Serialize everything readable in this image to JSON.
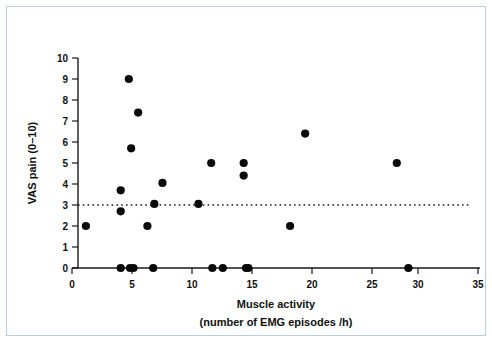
{
  "figure": {
    "background_color": "#ffffff",
    "border_color": "#b9cfdd"
  },
  "axes": {
    "x_title_line1": "Muscle activity",
    "x_title_line2": "(number of EMG episodes /h)",
    "y_title": "VAS pain (0–10)",
    "x_ticks": [
      "0",
      "5",
      "10",
      "15",
      "20",
      "25",
      "30",
      "35"
    ],
    "y_ticks": [
      "0",
      "1",
      "2",
      "3",
      "4",
      "5",
      "6",
      "7",
      "8",
      "9",
      "10"
    ]
  },
  "annotations": {
    "reference_line_value": 3,
    "reference_line_style": "dotted"
  },
  "chart_data": {
    "type": "scatter",
    "title": "",
    "xlabel": "Muscle activity (number of EMG episodes /h)",
    "ylabel": "VAS pain (0-10)",
    "xlim": [
      0,
      35
    ],
    "ylim": [
      0,
      10
    ],
    "xticks": [
      0,
      5,
      10,
      15,
      20,
      25,
      30,
      35
    ],
    "yticks": [
      0,
      1,
      2,
      3,
      4,
      5,
      6,
      7,
      8,
      9,
      10
    ],
    "grid": false,
    "legend": "none",
    "marker": "filled-circle",
    "marker_color": "#0a0a0a",
    "reference_lines": [
      {
        "orientation": "horizontal",
        "y": 3,
        "style": "dotted",
        "color": "#1a1a1a"
      }
    ],
    "points": [
      {
        "x": 1.2,
        "y": 2.0
      },
      {
        "x": 4.2,
        "y": 3.7
      },
      {
        "x": 4.2,
        "y": 2.7
      },
      {
        "x": 4.2,
        "y": 0.0
      },
      {
        "x": 4.9,
        "y": 9.0
      },
      {
        "x": 5.0,
        "y": 0.0
      },
      {
        "x": 5.1,
        "y": 5.7
      },
      {
        "x": 5.3,
        "y": 0.0
      },
      {
        "x": 5.7,
        "y": 7.4
      },
      {
        "x": 6.5,
        "y": 2.0
      },
      {
        "x": 7.0,
        "y": 0.0
      },
      {
        "x": 7.1,
        "y": 3.05
      },
      {
        "x": 7.8,
        "y": 4.05
      },
      {
        "x": 10.9,
        "y": 3.05
      },
      {
        "x": 12.0,
        "y": 5.0
      },
      {
        "x": 12.1,
        "y": 0.0
      },
      {
        "x": 13.0,
        "y": 0.0
      },
      {
        "x": 14.8,
        "y": 5.0
      },
      {
        "x": 14.8,
        "y": 4.4
      },
      {
        "x": 15.0,
        "y": 0.0
      },
      {
        "x": 15.2,
        "y": 0.0
      },
      {
        "x": 18.8,
        "y": 2.0
      },
      {
        "x": 20.1,
        "y": 6.4
      },
      {
        "x": 28.0,
        "y": 5.0
      },
      {
        "x": 29.0,
        "y": 0.0
      }
    ]
  }
}
